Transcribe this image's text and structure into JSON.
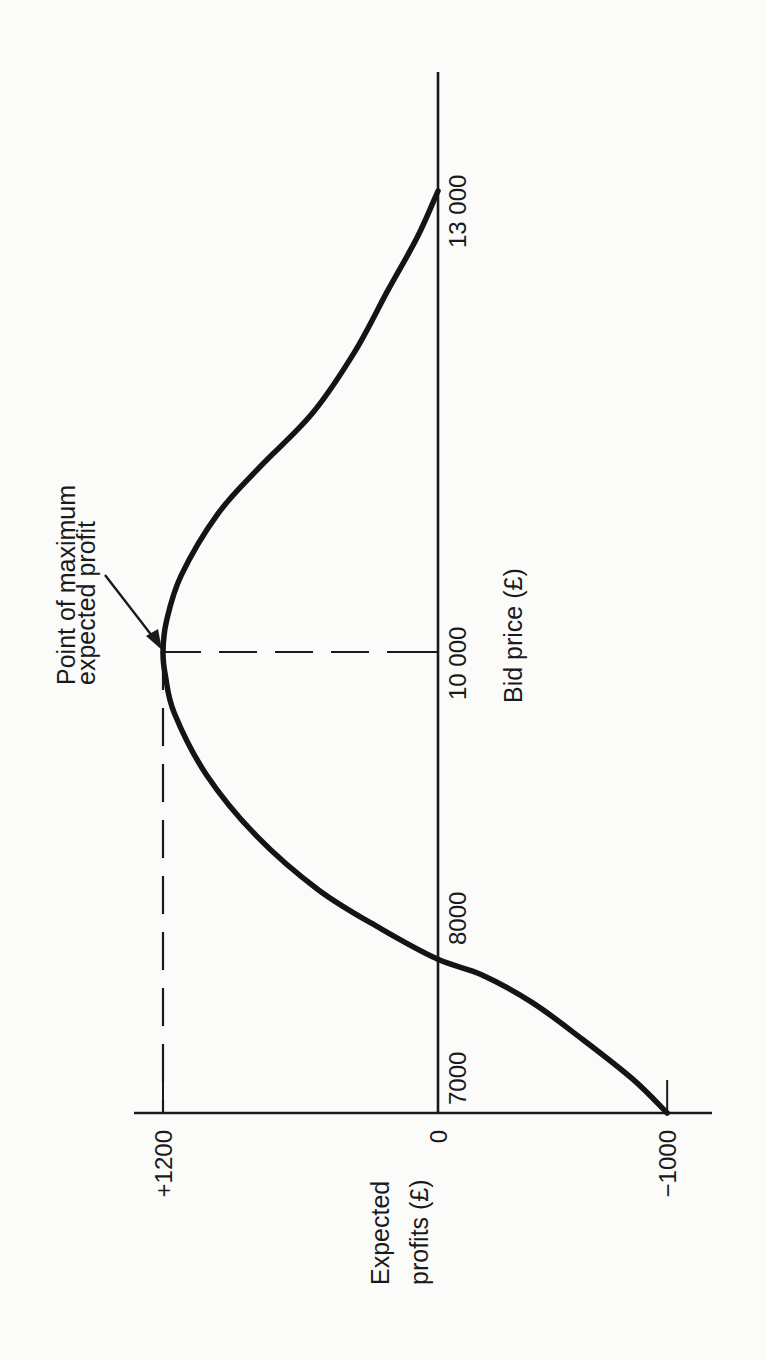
{
  "chart_data": {
    "type": "line",
    "orientation": "rotated 90° counter-clockwise (x-axis runs vertically, bottom-to-top)",
    "title": "",
    "xlabel": "Bid price (£)",
    "ylabel": "Expected profits (£)",
    "x_ticks": [
      {
        "value": 7000,
        "label": "7000"
      },
      {
        "value": 8000,
        "label": "8000"
      },
      {
        "value": 10000,
        "label": "10 000"
      },
      {
        "value": 13000,
        "label": "13 000"
      }
    ],
    "y_ticks": [
      {
        "value": 1200,
        "label": "+1200"
      },
      {
        "value": 0,
        "label": "0"
      },
      {
        "value": -1000,
        "label": "−1000"
      }
    ],
    "xlim": [
      7000,
      13400
    ],
    "ylim": [
      -1200,
      1320
    ],
    "grid": false,
    "legend": null,
    "series": [
      {
        "name": "Expected profit",
        "x": [
          7000,
          7220,
          7480,
          7720,
          7900,
          8000,
          8200,
          8450,
          8800,
          9200,
          9600,
          9850,
          10000,
          10200,
          10500,
          10900,
          11200,
          11550,
          11950,
          12350,
          12700,
          13000
        ],
        "y": [
          -1000,
          -850,
          -630,
          -410,
          -190,
          0,
          250,
          520,
          790,
          1010,
          1150,
          1190,
          1200,
          1185,
          1120,
          960,
          780,
          550,
          365,
          220,
          90,
          0
        ]
      }
    ],
    "reference_lines": [
      {
        "type": "horizontal-dashed",
        "y": 1200,
        "from_x": 7000,
        "to_x": 10000
      },
      {
        "type": "vertical-dashed",
        "x": 10000,
        "from_y": 0,
        "to_y": 1200
      }
    ],
    "annotations": [
      {
        "text_lines": [
          "Point of maximum",
          "expected profit"
        ],
        "arrow_to": {
          "x": 10000,
          "y": 1200
        }
      }
    ],
    "max_point": {
      "x": 10000,
      "y": 1200
    }
  }
}
